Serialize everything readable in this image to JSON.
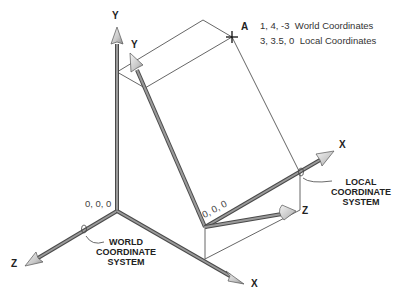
{
  "world_system": {
    "caption_lines": [
      "WORLD",
      "COORDINATE",
      "SYSTEM"
    ],
    "origin_label": "0, 0, 0",
    "axes": {
      "x": "X",
      "y": "Y",
      "z": "Z"
    }
  },
  "local_system": {
    "caption_lines": [
      "LOCAL",
      "COORDINATE",
      "SYSTEM"
    ],
    "origin_label": "0, 0, 0",
    "axes": {
      "x": "X",
      "y": "Y",
      "z": "Z"
    }
  },
  "point": {
    "label": "A",
    "world_coords": "1, 4, -3",
    "world_coords_label": "World Coordinates",
    "local_coords": "3, 3.5, 0",
    "local_coords_label": "Local Coordinates"
  },
  "colors": {
    "axis_shaft": "#8a8a8a",
    "axis_edge": "#4a4a4a",
    "box_line": "#555555",
    "text": "#222222"
  }
}
